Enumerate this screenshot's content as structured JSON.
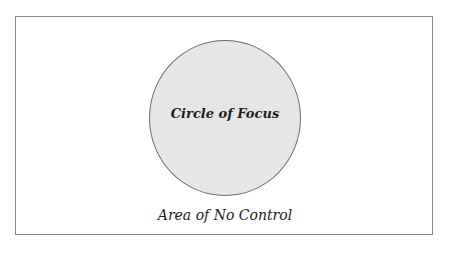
{
  "diagram": {
    "outer_area": {
      "label": "Area of No Control"
    },
    "inner_circle": {
      "label": "Circle of Focus",
      "fill": "#e6e6e6",
      "stroke": "#6e6e6e"
    },
    "frame_color": "#8a8a8a"
  }
}
